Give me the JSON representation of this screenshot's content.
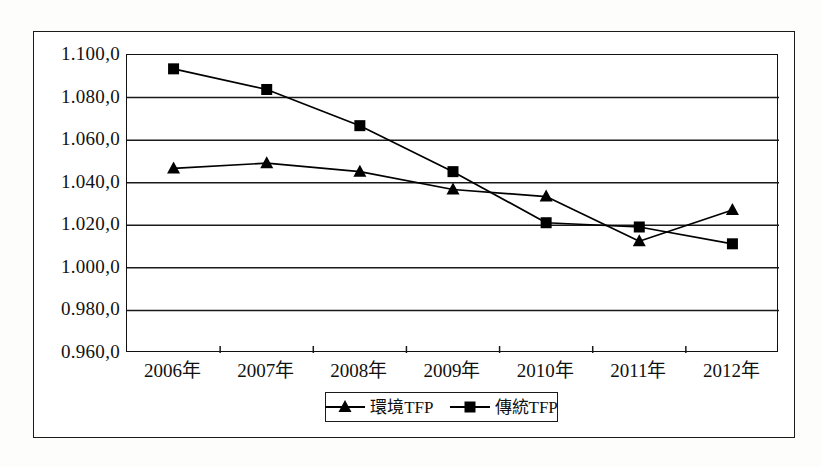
{
  "chart_data": {
    "type": "line",
    "title": "",
    "subtitle": "",
    "xlabel": "",
    "ylabel": "",
    "categories": [
      "2006年",
      "2007年",
      "2008年",
      "2009年",
      "2010年",
      "2011年",
      "2012年"
    ],
    "series": [
      {
        "name": "環境TFP",
        "marker": "triangle",
        "color": "#000000",
        "values": [
          1.0467,
          1.0492,
          1.0452,
          1.0368,
          1.0335,
          1.0125,
          1.0272
        ]
      },
      {
        "name": "傳統TFP",
        "marker": "square",
        "color": "#000000",
        "values": [
          1.0935,
          1.0838,
          1.0668,
          1.0452,
          1.0212,
          1.0192,
          1.0113
        ]
      }
    ],
    "ylim": [
      0.96,
      1.1
    ],
    "ytick_values": [
      1.1,
      1.08,
      1.06,
      1.04,
      1.02,
      1.0,
      0.98,
      0.96
    ],
    "ytick_labels": [
      "1.100,0",
      "1.080,0",
      "1.060,0",
      "1.040,0",
      "1.020,0",
      "1.000,0",
      "0.980,0",
      "0.960,0"
    ],
    "grid": "horizontal",
    "legend_position": "bottom-center"
  },
  "legend": {
    "entries": [
      {
        "label": "環境TFP",
        "marker": "triangle"
      },
      {
        "label": "傳統TFP",
        "marker": "square"
      }
    ]
  },
  "colors": {
    "line": "#000000",
    "grid": "#1a1a1a",
    "frame": "#1a1a1a",
    "background": "#ffffff"
  }
}
